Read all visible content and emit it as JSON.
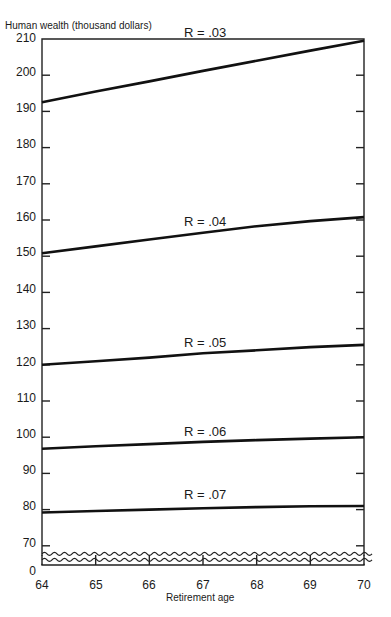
{
  "chart_data": {
    "type": "line",
    "title": "",
    "ylabel": "Human wealth (thousand dollars)",
    "xlabel": "Retirement age",
    "x": [
      64,
      65,
      66,
      67,
      68,
      69,
      70
    ],
    "xlim": [
      64,
      70
    ],
    "ylim": [
      0,
      210
    ],
    "axis_break": {
      "from": 0,
      "to": 70
    },
    "yticks": [
      0,
      70,
      80,
      90,
      100,
      110,
      120,
      130,
      140,
      150,
      160,
      170,
      180,
      190,
      200,
      210
    ],
    "xticks": [
      64,
      65,
      66,
      67,
      68,
      69,
      70
    ],
    "grid": false,
    "legend": "inline labels above each line",
    "series": [
      {
        "name": "R = .03",
        "values": [
          192.5,
          195.5,
          198.3,
          201.2,
          204.0,
          206.8,
          209.5
        ]
      },
      {
        "name": "R = .04",
        "values": [
          150.8,
          152.7,
          154.6,
          156.5,
          158.3,
          159.7,
          160.8
        ]
      },
      {
        "name": "R = .05",
        "values": [
          120.0,
          121.0,
          122.0,
          123.2,
          124.0,
          124.9,
          125.5
        ]
      },
      {
        "name": "R = .06",
        "values": [
          96.8,
          97.5,
          98.1,
          98.7,
          99.2,
          99.6,
          100.0
        ]
      },
      {
        "name": "R = .07",
        "values": [
          79.2,
          79.6,
          80.0,
          80.4,
          80.7,
          80.9,
          81.0
        ]
      }
    ]
  },
  "labels": {
    "ytitle": "Human wealth (thousand dollars)",
    "xtitle": "Retirement age",
    "yticks": [
      "210",
      "200",
      "190",
      "180",
      "170",
      "160",
      "150",
      "140",
      "130",
      "120",
      "110",
      "100",
      "90",
      "80",
      "70",
      "0"
    ],
    "xticks": [
      "64",
      "65",
      "66",
      "67",
      "68",
      "69",
      "70"
    ],
    "series": [
      "R = .03",
      "R = .04",
      "R = .05",
      "R = .06",
      "R = .07"
    ]
  }
}
